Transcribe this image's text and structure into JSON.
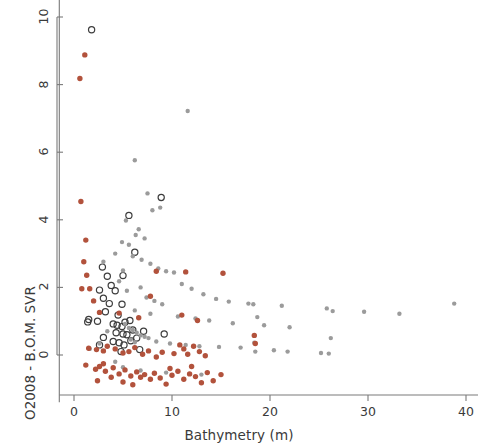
{
  "figure": {
    "background": "#ffffff",
    "frame_color": "#7a7a7a"
  },
  "chart_data": {
    "type": "scatter",
    "title": "",
    "xlabel": "Bathymetry (m)",
    "ylabel": "O2008 - B.O.M. SVR",
    "xlim": [
      -1.5,
      41.5
    ],
    "ylim": [
      -1.4,
      10.6
    ],
    "xticks": [
      0,
      10,
      20,
      30,
      40
    ],
    "yticks": [
      0,
      2,
      4,
      6,
      8,
      10
    ],
    "grid": false,
    "legend": "none",
    "series": [
      {
        "name": "dark-open-circle",
        "marker": "open-circle",
        "color": "#3d3d3d",
        "fill": "none",
        "radius": 3.1,
        "points": [
          [
            1.8,
            9.62
          ],
          [
            5.6,
            4.13
          ],
          [
            8.9,
            4.66
          ],
          [
            2.9,
            2.6
          ],
          [
            3.4,
            2.33
          ],
          [
            5.0,
            2.35
          ],
          [
            2.6,
            1.92
          ],
          [
            4.2,
            1.9
          ],
          [
            3.0,
            1.68
          ],
          [
            3.6,
            1.52
          ],
          [
            3.2,
            1.28
          ],
          [
            4.9,
            1.5
          ],
          [
            4.5,
            1.18
          ],
          [
            1.5,
            1.05
          ],
          [
            2.4,
            1.0
          ],
          [
            4.0,
            0.92
          ],
          [
            4.4,
            0.88
          ],
          [
            4.9,
            0.84
          ],
          [
            5.2,
            0.97
          ],
          [
            5.7,
            1.02
          ],
          [
            4.3,
            0.66
          ],
          [
            5.0,
            0.62
          ],
          [
            5.4,
            0.6
          ],
          [
            6.0,
            0.74
          ],
          [
            3.0,
            0.52
          ],
          [
            4.0,
            0.4
          ],
          [
            4.6,
            0.36
          ],
          [
            5.1,
            0.3
          ],
          [
            5.8,
            0.42
          ],
          [
            6.4,
            0.5
          ],
          [
            7.1,
            0.7
          ],
          [
            2.6,
            0.3
          ],
          [
            4.8,
            0.1
          ],
          [
            6.7,
            0.16
          ],
          [
            9.2,
            0.62
          ],
          [
            1.4,
            0.98
          ],
          [
            3.8,
            2.06
          ],
          [
            6.2,
            3.04
          ]
        ]
      },
      {
        "name": "gray-filled",
        "marker": "filled-circle",
        "color": "#9b9b9b",
        "fill": "#9b9b9b",
        "radius": 2.2,
        "points": [
          [
            11.6,
            7.22
          ],
          [
            6.2,
            5.76
          ],
          [
            7.5,
            4.78
          ],
          [
            8.0,
            4.28
          ],
          [
            8.8,
            4.36
          ],
          [
            5.3,
            3.98
          ],
          [
            6.6,
            3.72
          ],
          [
            6.3,
            3.55
          ],
          [
            7.2,
            3.45
          ],
          [
            4.9,
            3.34
          ],
          [
            5.6,
            3.26
          ],
          [
            4.2,
            3.0
          ],
          [
            6.0,
            2.92
          ],
          [
            6.9,
            2.82
          ],
          [
            7.8,
            2.7
          ],
          [
            3.0,
            2.76
          ],
          [
            8.6,
            2.56
          ],
          [
            9.4,
            2.48
          ],
          [
            5.0,
            2.5
          ],
          [
            10.2,
            2.44
          ],
          [
            4.6,
            2.18
          ],
          [
            11.0,
            2.1
          ],
          [
            6.8,
            2.0
          ],
          [
            12.0,
            1.96
          ],
          [
            5.4,
            1.9
          ],
          [
            13.2,
            1.8
          ],
          [
            7.4,
            1.7
          ],
          [
            14.5,
            1.66
          ],
          [
            8.2,
            1.6
          ],
          [
            15.8,
            1.58
          ],
          [
            9.0,
            1.5
          ],
          [
            17.8,
            1.52
          ],
          [
            18.3,
            1.5
          ],
          [
            18.7,
            1.12
          ],
          [
            21.2,
            1.46
          ],
          [
            25.8,
            1.38
          ],
          [
            26.4,
            1.3
          ],
          [
            29.6,
            1.28
          ],
          [
            33.2,
            1.22
          ],
          [
            38.8,
            1.52
          ],
          [
            6.2,
            1.32
          ],
          [
            7.8,
            1.22
          ],
          [
            10.6,
            1.14
          ],
          [
            12.4,
            1.08
          ],
          [
            13.8,
            1.02
          ],
          [
            16.2,
            0.94
          ],
          [
            19.4,
            0.88
          ],
          [
            22.0,
            0.82
          ],
          [
            26.2,
            0.5
          ],
          [
            5.2,
            0.92
          ],
          [
            5.6,
            0.8
          ],
          [
            6.0,
            0.74
          ],
          [
            6.4,
            0.66
          ],
          [
            6.8,
            0.58
          ],
          [
            7.2,
            0.54
          ],
          [
            7.6,
            0.5
          ],
          [
            5.8,
            0.46
          ],
          [
            6.2,
            0.38
          ],
          [
            8.4,
            0.4
          ],
          [
            9.8,
            0.34
          ],
          [
            11.4,
            0.3
          ],
          [
            12.8,
            0.26
          ],
          [
            14.8,
            0.24
          ],
          [
            17.0,
            0.22
          ],
          [
            18.4,
            0.36
          ],
          [
            18.5,
            0.1
          ],
          [
            20.4,
            0.14
          ],
          [
            21.8,
            0.1
          ],
          [
            25.2,
            0.06
          ],
          [
            26.0,
            0.04
          ],
          [
            3.4,
            0.7
          ],
          [
            2.6,
            0.34
          ],
          [
            1.6,
            0.18
          ],
          [
            4.2,
            -0.2
          ],
          [
            5.0,
            -0.36
          ],
          [
            6.8,
            -0.46
          ],
          [
            9.4,
            -0.52
          ],
          [
            13.0,
            -0.58
          ]
        ]
      },
      {
        "name": "red-filled",
        "marker": "filled-circle",
        "color": "#b2523c",
        "fill": "#b2523c",
        "radius": 2.7,
        "points": [
          [
            1.1,
            8.88
          ],
          [
            0.6,
            8.18
          ],
          [
            0.7,
            4.54
          ],
          [
            1.2,
            3.4
          ],
          [
            1.0,
            2.76
          ],
          [
            1.3,
            2.36
          ],
          [
            0.8,
            1.96
          ],
          [
            1.6,
            1.96
          ],
          [
            2.0,
            1.6
          ],
          [
            8.4,
            2.48
          ],
          [
            11.4,
            2.46
          ],
          [
            15.2,
            2.42
          ],
          [
            2.6,
            1.26
          ],
          [
            4.6,
            1.24
          ],
          [
            6.6,
            1.1
          ],
          [
            7.8,
            1.74
          ],
          [
            11.0,
            1.18
          ],
          [
            12.6,
            1.02
          ],
          [
            18.4,
            0.58
          ],
          [
            18.5,
            0.34
          ],
          [
            1.5,
            0.2
          ],
          [
            2.3,
            0.16
          ],
          [
            3.0,
            0.12
          ],
          [
            3.4,
            0.26
          ],
          [
            4.2,
            0.18
          ],
          [
            5.0,
            0.06
          ],
          [
            5.6,
            0.1
          ],
          [
            6.2,
            0.22
          ],
          [
            7.0,
            0.02
          ],
          [
            7.6,
            0.12
          ],
          [
            8.4,
            -0.06
          ],
          [
            9.0,
            0.08
          ],
          [
            10.2,
            0.04
          ],
          [
            10.8,
            0.3
          ],
          [
            11.2,
            0.18
          ],
          [
            11.6,
            0.02
          ],
          [
            12.2,
            0.26
          ],
          [
            12.8,
            0.1
          ],
          [
            13.4,
            -0.02
          ],
          [
            1.2,
            -0.3
          ],
          [
            2.2,
            -0.42
          ],
          [
            2.6,
            -0.34
          ],
          [
            3.0,
            -0.26
          ],
          [
            3.2,
            -0.48
          ],
          [
            4.0,
            -0.38
          ],
          [
            4.6,
            -0.56
          ],
          [
            5.2,
            -0.44
          ],
          [
            5.8,
            -0.62
          ],
          [
            6.4,
            -0.5
          ],
          [
            6.8,
            -0.66
          ],
          [
            7.2,
            -0.58
          ],
          [
            7.8,
            -0.72
          ],
          [
            8.2,
            -0.54
          ],
          [
            8.8,
            -0.68
          ],
          [
            9.4,
            -0.86
          ],
          [
            10.0,
            -0.6
          ],
          [
            10.6,
            -0.48
          ],
          [
            11.2,
            -0.72
          ],
          [
            11.8,
            -0.56
          ],
          [
            12.4,
            -0.64
          ],
          [
            13.0,
            -0.82
          ],
          [
            13.6,
            -0.52
          ],
          [
            14.2,
            -0.76
          ],
          [
            15.0,
            -0.58
          ],
          [
            2.4,
            -0.76
          ],
          [
            3.8,
            -0.66
          ],
          [
            5.0,
            -0.8
          ],
          [
            6.0,
            -0.88
          ],
          [
            9.8,
            -0.4
          ],
          [
            12.0,
            -0.34
          ]
        ]
      }
    ]
  }
}
